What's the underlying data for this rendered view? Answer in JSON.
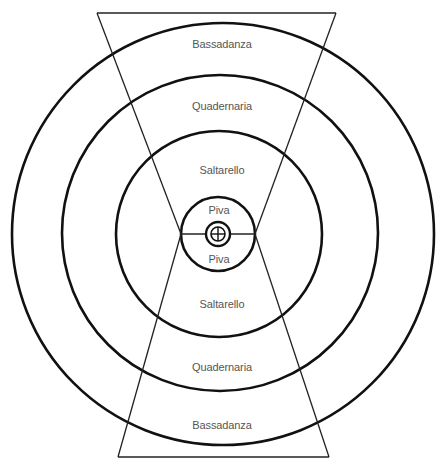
{
  "diagram": {
    "title": "",
    "type": "concentric-circles-with-hourglass",
    "center": {
      "x": 220,
      "y": 234
    },
    "rings": [
      {
        "name": "bassadanza-ring",
        "label": "Bassadanza",
        "radius": 212
      },
      {
        "name": "quadernaria-ring",
        "label": "Quadernaria",
        "radius": 158
      },
      {
        "name": "saltarello-ring",
        "label": "Saltarello",
        "radius": 103
      },
      {
        "name": "piva-ring",
        "label": "Piva",
        "radius": 37
      },
      {
        "name": "inner-ring",
        "label": "",
        "radius": 13
      }
    ],
    "labels_top": {
      "bassadanza": "Bassadanza",
      "quadernaria": "Quadernaria",
      "saltarello": "Saltarello",
      "piva": "Piva"
    },
    "labels_bottom": {
      "piva": "Piva",
      "saltarello": "Saltarello",
      "quadernaria": "Quadernaria",
      "bassadanza": "Bassadanza"
    },
    "center_symbol": "circled-plus",
    "colors": {
      "stroke": "#111111",
      "text": "#555555",
      "background": "#ffffff"
    }
  }
}
